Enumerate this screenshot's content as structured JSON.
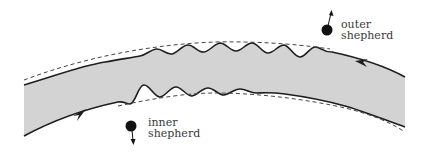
{
  "diagram": {
    "type": "planetary-ring-shepherd-moons",
    "colors": {
      "ring_fill": "#d3d3d3",
      "edge_stroke": "#1e1e1e",
      "dashed_stroke": "#444444",
      "moon_fill": "#111111",
      "text": "#3a3a3a"
    },
    "labels": {
      "outer_line1": "outer",
      "outer_line2": "shepherd",
      "inner_line1": "inner",
      "inner_line2": "shepherd"
    },
    "moons": [
      {
        "name": "outer shepherd",
        "direction": "up"
      },
      {
        "name": "inner shepherd",
        "direction": "down"
      }
    ],
    "flow_arrows": [
      {
        "edge": "inner",
        "direction": "right"
      },
      {
        "edge": "outer",
        "direction": "left"
      }
    ]
  }
}
